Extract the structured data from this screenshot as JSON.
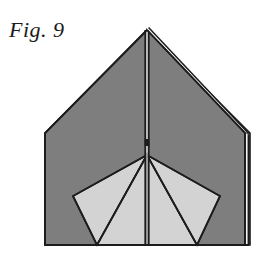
{
  "figure": {
    "caption": "Fig. 9",
    "background_color": "#ffffff",
    "colors": {
      "paper_dark": "#7e7e7e",
      "paper_light": "#d3d3d3",
      "outline": "#1c1c1c",
      "caption_text": "#1b1b1b",
      "highlight_sliver": "#f2f2f2"
    },
    "geometry": {
      "canvas": {
        "width": 275,
        "height": 257
      },
      "apex": {
        "x": 147,
        "y": 30
      },
      "left_shoulder": {
        "x": 45,
        "y": 133
      },
      "right_shoulder": {
        "x": 245,
        "y": 133
      },
      "left_bottom": {
        "x": 45,
        "y": 245
      },
      "right_bottom": {
        "x": 245,
        "y": 245
      },
      "fan_center": {
        "x": 147,
        "y": 155
      },
      "fan_left_corner": {
        "x": 73,
        "y": 196
      },
      "fan_right_corner": {
        "x": 220,
        "y": 196
      },
      "fan_left_notch": {
        "x": 97,
        "y": 245
      },
      "fan_right_notch": {
        "x": 197,
        "y": 245
      },
      "center_fold_top": {
        "x": 147,
        "y": 30
      },
      "center_fold_bottom": {
        "x": 147,
        "y": 245
      },
      "right_edge_layer_offset": 5
    },
    "shapes": [
      {
        "name": "body-left-half",
        "fill": "paper_dark"
      },
      {
        "name": "body-right-half",
        "fill": "paper_dark"
      },
      {
        "name": "fan-flap-outer-left",
        "fill": "paper_light"
      },
      {
        "name": "fan-flap-inner-left",
        "fill": "paper_light"
      },
      {
        "name": "fan-flap-inner-right",
        "fill": "paper_light"
      },
      {
        "name": "fan-flap-outer-right",
        "fill": "paper_light"
      }
    ],
    "fold_lines": [
      {
        "name": "center-vertical-fold"
      },
      {
        "name": "fan-radial-left-outer"
      },
      {
        "name": "fan-radial-left-inner"
      },
      {
        "name": "fan-radial-right-inner"
      },
      {
        "name": "fan-radial-right-outer"
      },
      {
        "name": "right-edge-layer-line"
      }
    ]
  }
}
